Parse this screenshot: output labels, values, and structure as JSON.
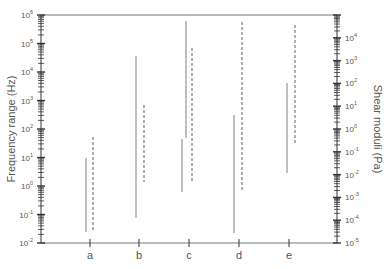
{
  "chart_data": {
    "type": "range",
    "title": "",
    "categories": [
      "a",
      "b",
      "c",
      "d",
      "e"
    ],
    "left_axis": {
      "label": "Frequency range (Hz)",
      "scale": "log",
      "range": [
        0.01,
        1000000
      ],
      "ticks": [
        "10^-2",
        "10^-1",
        "10^0",
        "10^1",
        "10^2",
        "10^3",
        "10^4",
        "10^5",
        "10^6"
      ]
    },
    "right_axis": {
      "label": "Shear moduli (Pa)",
      "scale": "log",
      "range": [
        1e-05,
        100000
      ],
      "ticks": [
        "10^-5",
        "10^-4",
        "10^-3",
        "10^-2",
        "10^-1",
        "10^0",
        "10^1",
        "10^2",
        "10^3",
        "10^4"
      ]
    },
    "series": [
      {
        "name": "Frequency range",
        "style": "solid",
        "axis": "left",
        "ranges": {
          "a": [
            [
              0.025,
              10
            ]
          ],
          "b": [
            [
              0.075,
              36000
            ]
          ],
          "c": [
            [
              48,
              600000
            ],
            [
              0.6,
              45
            ]
          ],
          "d": [
            [
              0.022,
              300
            ]
          ],
          "e": [
            [
              2.9,
              4000
            ]
          ]
        }
      },
      {
        "name": "Shear moduli",
        "style": "dashed",
        "axis": "right",
        "ranges": {
          "a": [
            [
              3.7e-05,
              0.45
            ]
          ],
          "b": [
            [
              0.0048,
              11
            ]
          ],
          "c": [
            [
              0.0048,
              3500
            ]
          ],
          "d": [
            [
              0.0017,
              49000
            ]
          ],
          "e": [
            [
              0.25,
              36000
            ]
          ]
        }
      }
    ],
    "grid": false,
    "legend": "none"
  },
  "segments": {
    "solid": [
      {
        "cat": "a",
        "x": 86,
        "y1": 158,
        "y2": 232
      },
      {
        "cat": "b",
        "x": 136,
        "y1": 56,
        "y2": 218
      },
      {
        "cat": "c",
        "x": 186,
        "y1": 21,
        "y2": 138
      },
      {
        "cat": "c",
        "x": 182,
        "y1": 139,
        "y2": 192
      },
      {
        "cat": "d",
        "x": 234,
        "y1": 115,
        "y2": 233
      },
      {
        "cat": "e",
        "x": 287,
        "y1": 83,
        "y2": 173
      }
    ],
    "dashed": [
      {
        "cat": "a",
        "x": 93,
        "y1": 137,
        "y2": 230
      },
      {
        "cat": "b",
        "x": 144,
        "y1": 105,
        "y2": 182
      },
      {
        "cat": "c",
        "x": 192,
        "y1": 48,
        "y2": 182
      },
      {
        "cat": "d",
        "x": 242,
        "y1": 22,
        "y2": 192
      },
      {
        "cat": "e",
        "x": 295,
        "y1": 25,
        "y2": 143
      }
    ]
  },
  "category_positions": [
    90,
    139,
    189,
    239,
    289
  ],
  "colors": {
    "axis": "#333333",
    "frame": "#777777",
    "solid": "#8a8a8a",
    "dashed": "#6e6e6e",
    "text": "#555555"
  }
}
